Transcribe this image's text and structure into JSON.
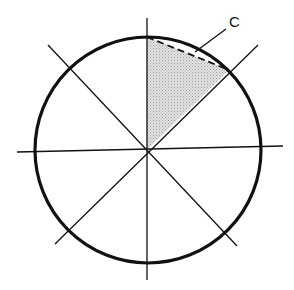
{
  "diagram": {
    "type": "circle-sector-geometry",
    "width": 294,
    "height": 290,
    "colors": {
      "stroke": "#111111",
      "shade": "#cfcfcf",
      "background": "#ffffff"
    },
    "circle": {
      "cx": 148,
      "cy": 150,
      "r": 113,
      "stroke_width": 3.2
    },
    "axes": [
      {
        "name": "vertical-axis",
        "x1": 147,
        "y1": 18,
        "x2": 147,
        "y2": 280
      },
      {
        "name": "horizontal-axis",
        "x1": 17,
        "y1": 152,
        "x2": 283,
        "y2": 146
      },
      {
        "name": "diagonal-nw-se",
        "x1": 48,
        "y1": 45,
        "x2": 237,
        "y2": 246
      },
      {
        "name": "diagonal-sw-ne",
        "x1": 55,
        "y1": 244,
        "x2": 258,
        "y2": 45
      }
    ],
    "shaded_sector": {
      "points": "147,150 147,37 229,70"
    },
    "chord": {
      "x1": 147,
      "y1": 37,
      "x2": 229,
      "y2": 70,
      "dash": "7,4"
    },
    "leader": {
      "x1": 195,
      "y1": 52,
      "x2": 226,
      "y2": 29
    },
    "label": {
      "text": "C",
      "x": 229,
      "y": 27
    }
  }
}
